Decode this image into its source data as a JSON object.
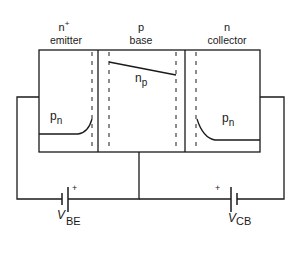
{
  "diagram": {
    "regions": [
      {
        "name": "emitter",
        "type_label": "n",
        "type_sup": "+",
        "label": "emitter",
        "carrier_label": "p",
        "carrier_sub": "n"
      },
      {
        "name": "base",
        "type_label": "p",
        "type_sup": "",
        "label": "base",
        "carrier_label": "n",
        "carrier_sub": "p"
      },
      {
        "name": "collector",
        "type_label": "n",
        "type_sup": "",
        "label": "collector",
        "carrier_label": "p",
        "carrier_sub": "n"
      }
    ],
    "sources": [
      {
        "name": "VBE",
        "main": "V",
        "sub": "BE",
        "polarity": "+"
      },
      {
        "name": "VCB",
        "main": "V",
        "sub": "CB",
        "polarity": "+"
      }
    ],
    "colors": {
      "line": "#1a1a1a",
      "background": "#ffffff"
    }
  }
}
